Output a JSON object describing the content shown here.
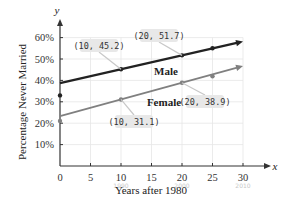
{
  "chart_data": {
    "type": "line",
    "title": "",
    "xlabel": "Years after 1980",
    "ylabel": "Percentage Never Married",
    "x_axis_symbol": "x",
    "y_axis_symbol": "y",
    "xlim": [
      0,
      30
    ],
    "ylim": [
      0,
      60
    ],
    "xticks": [
      0,
      5,
      10,
      15,
      20,
      25,
      30
    ],
    "yticks": [
      10,
      20,
      30,
      40,
      50,
      60
    ],
    "ytick_labels": [
      "10%",
      "20%",
      "30%",
      "40%",
      "50%",
      "60%"
    ],
    "grid": true,
    "legend": "inline labels",
    "series": [
      {
        "name": "Male",
        "color": "#222222",
        "line": {
          "x": [
            0,
            30
          ],
          "y": [
            38.7,
            58.2
          ]
        },
        "points": {
          "x": [
            0,
            10,
            20,
            25
          ],
          "y": [
            33,
            45.2,
            51.7,
            55
          ]
        },
        "callouts": [
          {
            "text": "(10, 45.2)",
            "x": 10,
            "y": 45.2
          },
          {
            "text": "(20, 51.7)",
            "x": 20,
            "y": 51.7
          }
        ]
      },
      {
        "name": "Female",
        "color": "#808080",
        "line": {
          "x": [
            0,
            30
          ],
          "y": [
            23.3,
            46.7
          ]
        },
        "points": {
          "x": [
            0,
            10,
            20,
            25
          ],
          "y": [
            21,
            31.1,
            38.9,
            41.9
          ]
        },
        "callouts": [
          {
            "text": "(10, 31.1)",
            "x": 10,
            "y": 31.1
          },
          {
            "text": "(20, 38.9)",
            "x": 20,
            "y": 38.9
          }
        ]
      }
    ],
    "annotations": [
      {
        "text": "1990",
        "x": 10,
        "note": "handwritten under tick"
      },
      {
        "text": "2000",
        "x": 20,
        "note": "handwritten under tick"
      },
      {
        "text": "2010",
        "x": 30,
        "note": "handwritten under tick"
      }
    ]
  }
}
